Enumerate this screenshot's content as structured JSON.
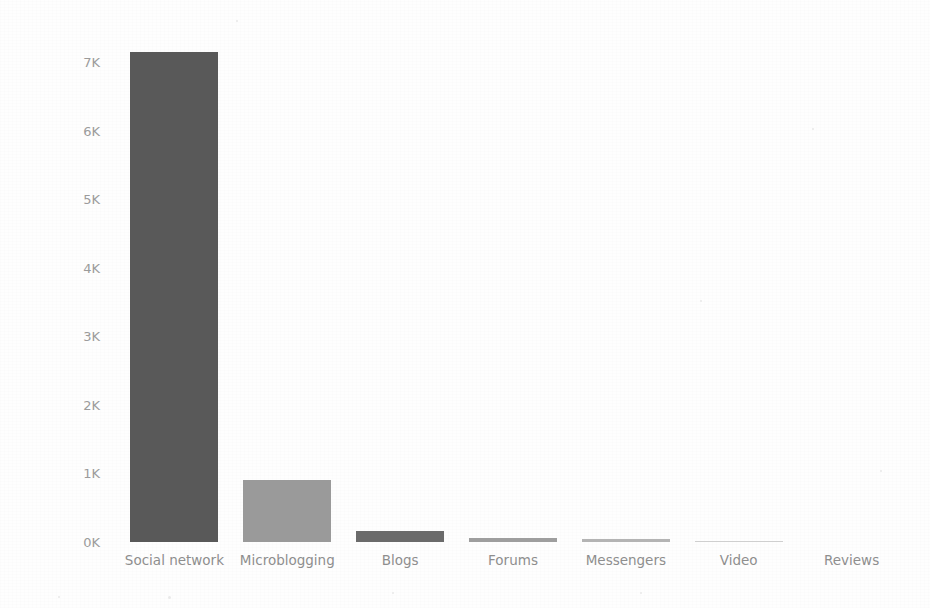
{
  "chart_data": {
    "type": "bar",
    "title": "",
    "subtitle": "",
    "xlabel": "",
    "ylabel": "Number of Records",
    "categories": [
      "Social network",
      "Microblogging",
      "Blogs",
      "Forums",
      "Messengers",
      "Video",
      "Reviews"
    ],
    "values": [
      7150,
      900,
      160,
      55,
      40,
      15,
      0
    ],
    "value_labels": [
      "7.15K",
      "0.9K",
      "0.16K",
      "0.055K",
      "0.04K",
      "0.015K",
      "0K"
    ],
    "ylim": [
      0,
      7500
    ],
    "yticks": [
      0,
      1000,
      2000,
      3000,
      4000,
      5000,
      6000,
      7000
    ],
    "ytick_labels": [
      "0K",
      "1K",
      "2K",
      "3K",
      "4K",
      "5K",
      "6K",
      "7K"
    ],
    "grid": false,
    "legend": null,
    "legend_position": "none",
    "bar_colors": [
      "#595959",
      "#9a9a9a",
      "#6b6b6b",
      "#9e9e9e",
      "#b4b4b4",
      "#cfcfcf",
      "#ffffff"
    ],
    "background_color": "#ffffff",
    "axis_text_color": "#8e8e8e",
    "axis_title_color": "#4a4a4a"
  }
}
